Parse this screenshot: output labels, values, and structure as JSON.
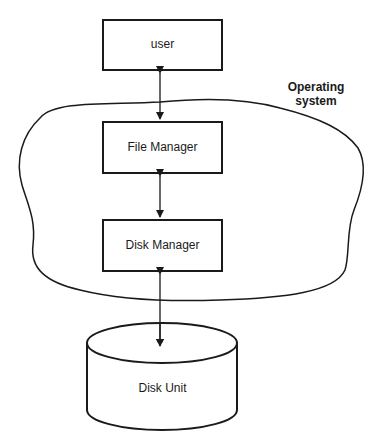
{
  "diagram": {
    "nodes": [
      {
        "id": "user",
        "label": "user",
        "shape": "rectangle"
      },
      {
        "id": "file_manager",
        "label": "File Manager",
        "shape": "rectangle"
      },
      {
        "id": "disk_manager",
        "label": "Disk Manager",
        "shape": "rectangle"
      },
      {
        "id": "disk_unit",
        "label": "Disk Unit",
        "shape": "cylinder"
      }
    ],
    "edges": [
      {
        "from": "user",
        "to": "file_manager",
        "type": "bidirectional"
      },
      {
        "from": "file_manager",
        "to": "disk_manager",
        "type": "bidirectional"
      },
      {
        "from": "disk_manager",
        "to": "disk_unit",
        "type": "bidirectional"
      }
    ],
    "region": {
      "label_line1": "Operating",
      "label_line2": "system",
      "contains": [
        "file_manager",
        "disk_manager"
      ]
    }
  },
  "colors": {
    "stroke": "#1a1a1a",
    "background": "#ffffff"
  }
}
